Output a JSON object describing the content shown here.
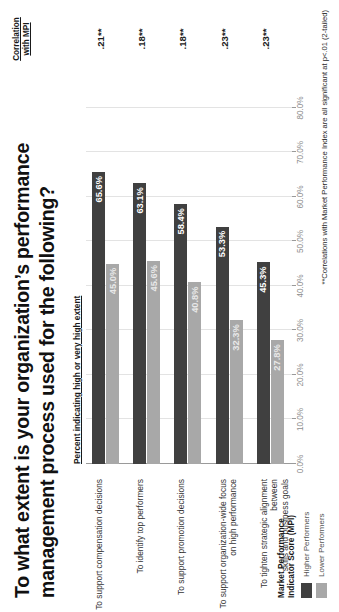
{
  "title": "To what extent is your organization’s performance management process used for the following?",
  "subhead": "Percent indicating high or very high extent",
  "correlation_column": {
    "header_line1": "Correlation",
    "header_line2": "with MPI",
    "values": [
      ".21**",
      ".18**",
      ".18**",
      ".23**",
      ".23**"
    ]
  },
  "legend": {
    "title_line1": "Market Performance",
    "title_line2": "Indicator Score (MPI)",
    "items": [
      {
        "label": "Higher Performers",
        "color": "#404040"
      },
      {
        "label": "Lower Performers",
        "color": "#a8a8a8"
      }
    ]
  },
  "footnote": "**Correlations with Market Performance Index are all significant at  p<.01 (2-tailed)",
  "chart_data": {
    "type": "bar",
    "orientation": "horizontal",
    "title": "To what extent is your organization’s performance management process used for the following?",
    "subtitle": "Percent indicating high or very high extent",
    "xlabel": "",
    "ylabel": "",
    "xlim": [
      0,
      80
    ],
    "xticks": [
      0,
      10,
      20,
      30,
      40,
      50,
      60,
      70,
      80
    ],
    "xtick_labels": [
      "0.0%",
      "10.0%",
      "20.0%",
      "30.0%",
      "40.0%",
      "50.0%",
      "60.0%",
      "70.0%",
      "80.0%"
    ],
    "grid": true,
    "legend_position": "bottom-left",
    "categories": [
      "To support compensation decisions",
      "To identify top performers",
      "To support promotion decisions",
      "To support organization-wide focus on high performance",
      "To tighten strategic alignment between skills and business goals"
    ],
    "category_lines": [
      [
        "To support compensation decisions"
      ],
      [
        "To identify top performers"
      ],
      [
        "To support promotion decisions"
      ],
      [
        "To support organization-wide focus",
        "on high performance"
      ],
      [
        "To tighten strategic alignment between",
        "skills and business goals"
      ]
    ],
    "series": [
      {
        "name": "Higher Performers",
        "color": "#404040",
        "values": [
          65.6,
          63.1,
          58.4,
          53.3,
          45.3
        ],
        "labels": [
          "65.6%",
          "63.1%",
          "58.4%",
          "53.3%",
          "45.3%"
        ]
      },
      {
        "name": "Lower Performers",
        "color": "#a8a8a8",
        "values": [
          45.0,
          45.6,
          40.8,
          32.3,
          27.8
        ],
        "labels": [
          "45.0%",
          "45.6%",
          "40.8%",
          "32.3%",
          "27.8%"
        ]
      }
    ],
    "annotations": {
      "correlation_header": "Correlation with MPI",
      "correlation_values": [
        ".21**",
        ".18**",
        ".18**",
        ".23**",
        ".23**"
      ],
      "footnote": "**Correlations with Market Performance Index are all significant at  p<.01 (2-tailed)"
    }
  }
}
